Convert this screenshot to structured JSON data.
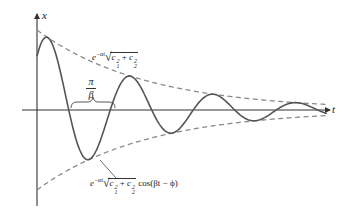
{
  "figure": {
    "axes": {
      "y_label": "x",
      "x_label": "t"
    },
    "labels": {
      "upper_envelope": {
        "prefix": "e",
        "exponent": "−αt",
        "c1": "c",
        "c1_sub": "1",
        "c1_sup": "2",
        "plus": "+",
        "c2": "c",
        "c2_sub": "2",
        "c2_sup": "2"
      },
      "half_period": {
        "numerator": "π",
        "denominator": "β"
      },
      "solution": {
        "prefix": "e",
        "exponent": "−αt",
        "c1": "c",
        "c1_sub": "1",
        "c1_sup": "2",
        "plus": "+",
        "c2": "c",
        "c2_sub": "2",
        "c2_sup": "2",
        "trig": "cos(βt − ϕ)"
      }
    }
  },
  "chart_data": {
    "type": "line",
    "title": "",
    "xlabel": "t",
    "ylabel": "x",
    "grid": false,
    "legend": "none",
    "series": [
      {
        "name": "e^{-αt}√(c1²+c2²) cos(βt − ϕ)",
        "style": "solid",
        "role": "damped oscillation"
      },
      {
        "name": "e^{-αt}√(c1²+c2²)",
        "style": "dashed",
        "role": "upper envelope"
      },
      {
        "name": "−e^{-αt}√(c1²+c2²)",
        "style": "dashed",
        "role": "lower envelope"
      }
    ],
    "annotations": [
      {
        "text": "π/β",
        "meaning": "half period, bracket between consecutive zero crossings"
      },
      {
        "text": "e^{-αt}√(c1²+c2²)",
        "points_to": "upper envelope"
      },
      {
        "text": "e^{-αt}√(c1²+c2²) cos(βt − ϕ)",
        "points_to": "solution curve"
      }
    ],
    "geometry_px": {
      "origin": [
        37,
        110
      ],
      "t_axis_end": 330,
      "x_axis_top": 14,
      "x_axis_bottom": 206,
      "amplitude0": 80,
      "decay_per_px": 0.0092,
      "half_period_px": 41.5,
      "phase_px": 11,
      "t_end": 327
    },
    "colors": {
      "curve": "#555555",
      "envelope": "#888888",
      "axes": "#333333"
    }
  }
}
